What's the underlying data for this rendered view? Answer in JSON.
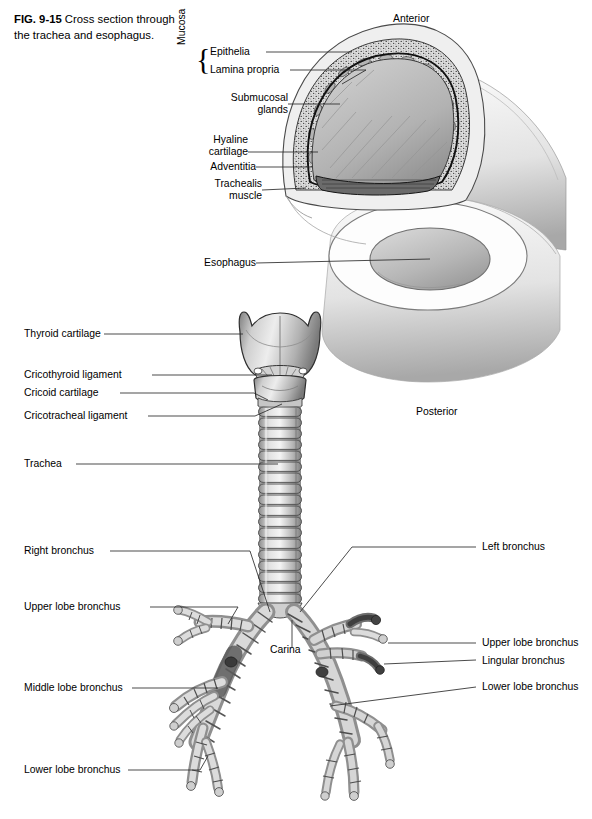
{
  "figure": {
    "number": "FIG. 9-15",
    "caption": "Cross section through the trachea and esophagus."
  },
  "orientation": {
    "anterior": "Anterior",
    "posterior": "Posterior"
  },
  "cross_section_labels": {
    "mucosa_group": "Mucosa",
    "epithelia": "Epithelia",
    "lamina_propria": "Lamina propria",
    "submucosal_glands_line1": "Submucosal",
    "submucosal_glands_line2": "glands",
    "hyaline_cartilage_line1": "Hyaline",
    "hyaline_cartilage_line2": "cartilage",
    "adventitia": "Adventitia",
    "trachealis_line1": "Trachealis",
    "trachealis_line2": "muscle",
    "esophagus": "Esophagus"
  },
  "airway_labels": {
    "thyroid_cartilage": "Thyroid cartilage",
    "cricothyroid_ligament": "Cricothyroid ligament",
    "cricoid_cartilage": "Cricoid cartilage",
    "cricotracheal_ligament": "Cricotracheal ligament",
    "trachea": "Trachea",
    "right_bronchus": "Right bronchus",
    "right_upper_lobe_bronchus": "Upper lobe bronchus",
    "middle_lobe_bronchus": "Middle lobe bronchus",
    "right_lower_lobe_bronchus": "Lower lobe bronchus",
    "carina": "Carina",
    "left_bronchus": "Left bronchus",
    "left_upper_lobe_bronchus": "Upper lobe bronchus",
    "lingular_bronchus": "Lingular bronchus",
    "left_lower_lobe_bronchus": "Lower lobe bronchus"
  },
  "palette": {
    "ink": "#000000",
    "leader": "#3a3a3a",
    "tissue_light": "#e8e8e8",
    "tissue_mid": "#c9c9c9",
    "tissue_dark": "#9a9a9a",
    "lumen": "#b9b9b9",
    "outline": "#1a1a1a"
  }
}
